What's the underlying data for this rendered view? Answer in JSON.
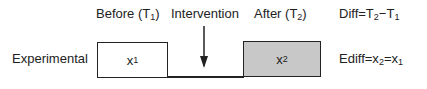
{
  "diagram": {
    "headers": {
      "before": "Before (T",
      "before_sub": "1",
      "intervention": "Intervention",
      "after": "After (T",
      "after_sub": "2",
      "diff": "Diff=T",
      "diff_sub2": "2",
      "diff_minus": "−T",
      "diff_sub1": "1"
    },
    "row_label": "Experimental",
    "box_before": {
      "text": "x",
      "sub": "1",
      "fill": "#ffffff"
    },
    "box_after": {
      "text": "x",
      "sub": "2",
      "fill": "#c8c8c8"
    },
    "ediff": {
      "text": "Ediff=x",
      "sub2": "2",
      "eq": "=x",
      "sub1": "1"
    },
    "close_paren": ")"
  }
}
